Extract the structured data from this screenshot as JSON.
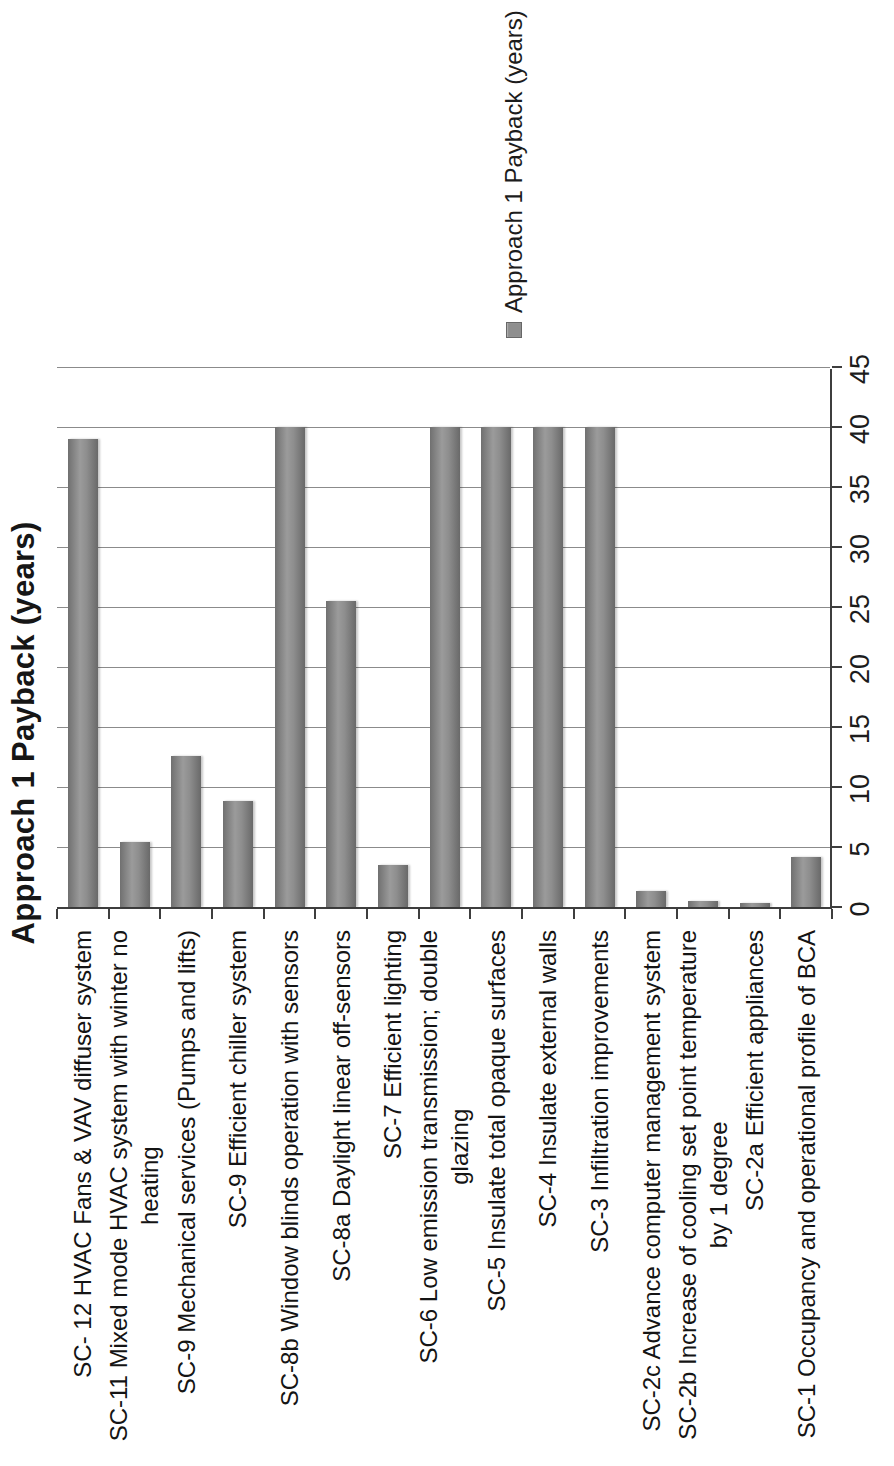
{
  "page": {
    "background": "#ffffff"
  },
  "chart_data": {
    "type": "bar",
    "orientation": "horizontal-rotated-90ccw",
    "title": "Approach 1 Payback (years)",
    "series_name": "Approach 1 Payback (years)",
    "legend": {
      "label": "Approach 1 Payback (years)",
      "position": "right",
      "marker": "square"
    },
    "categories": [
      "SC- 12 HVAC Fans & VAV diffuser system",
      "SC-11 Mixed mode HVAC system with winter no\nheating",
      "SC-9 Mechanical services (Pumps and lifts)",
      "SC-9 Efficient chiller system",
      "SC-8b Window blinds operation with sensors",
      "SC-8a Daylight linear off-sensors",
      "SC-7 Efficient lighting",
      "SC-6 Low emission transmission; double\nglazing",
      "SC-5 Insulate total opaque surfaces",
      "SC-4 Insulate external walls",
      "SC-3 Infiltration improvements",
      "SC-2c Advance computer management system",
      "SC-2b Increase of cooling set point temperature\nby 1 degree",
      "SC-2a Efficient appliances",
      "SC-1 Occupancy and operational profile of BCA"
    ],
    "values": [
      39,
      5.4,
      12.6,
      8.8,
      40,
      25.5,
      3.5,
      40,
      40,
      40,
      40,
      1.3,
      0.5,
      0.3,
      4.2
    ],
    "value_unit": "years",
    "xlabel": "",
    "ylabel": "",
    "xlim": [
      0,
      45
    ],
    "ticks": [
      0,
      5,
      10,
      15,
      20,
      25,
      30,
      35,
      40,
      45
    ],
    "grid": true,
    "colors": {
      "bar_fill": "#8e8e8e",
      "bar_edge": "#696969",
      "gridline": "#8b8b8b",
      "axis": "#3e3e3e",
      "text": "#161616",
      "background": "#ffffff"
    }
  }
}
